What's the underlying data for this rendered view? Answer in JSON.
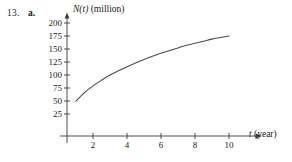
{
  "exercise": {
    "number": "13.",
    "part": "a."
  },
  "axes": {
    "y_label_func": "N(t)",
    "y_label_units": "(million)",
    "x_label_var": "t",
    "x_label_units": "(year)",
    "y_ticks": [
      "25",
      "50",
      "75",
      "100",
      "125",
      "150",
      "175",
      "200"
    ],
    "x_ticks": [
      "2",
      "4",
      "6",
      "8",
      "10"
    ],
    "axis_color": "#3a3a3a",
    "curve_color": "#4a4a4a"
  },
  "chart_data": {
    "type": "line",
    "title": "",
    "xlabel": "t (year)",
    "ylabel": "N(t) (million)",
    "xlim": [
      0,
      11
    ],
    "ylim": [
      0,
      210
    ],
    "grid": false,
    "legend": "none",
    "x_tick_values": [
      2,
      4,
      6,
      8,
      10
    ],
    "y_tick_values": [
      25,
      50,
      75,
      100,
      125,
      150,
      175,
      200
    ],
    "series": [
      {
        "name": "N(t)",
        "x": [
          1,
          1.5,
          2,
          2.5,
          3,
          3.5,
          4,
          4.5,
          5,
          5.5,
          6,
          6.5,
          7,
          7.5,
          8,
          8.5,
          9,
          9.5,
          10
        ],
        "values": [
          50,
          66,
          79,
          90,
          100,
          108,
          116,
          123,
          130,
          136,
          142,
          147,
          152,
          157,
          161,
          165,
          169,
          172,
          175
        ]
      }
    ]
  }
}
